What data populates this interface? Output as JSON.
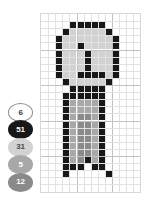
{
  "legend": {
    "items": [
      {
        "label": "6",
        "fill": "#ffffff",
        "text": "#3a3a3a",
        "outlined": true
      },
      {
        "label": "51",
        "fill": "#181818",
        "text": "#ffffff",
        "outlined": false
      },
      {
        "label": "31",
        "fill": "#d2d2d2",
        "text": "#4a4a4a",
        "outlined": false
      },
      {
        "label": "5",
        "fill": "#a8a8a8",
        "text": "#ffffff",
        "outlined": false
      },
      {
        "label": "12",
        "fill": "#8a8a8a",
        "text": "#ffffff",
        "outlined": false
      }
    ]
  },
  "grid": {
    "columns": 14,
    "rows": 25,
    "cell_size": 7.1,
    "line_color": "#e2e2e2",
    "border_color": "#d7d7d7",
    "palette": {
      "dark": "#181818",
      "light": "#d2d2d2",
      "mid": "#a8a8a8",
      "shade": "#8a8a8a",
      "empty": "#ffffff"
    },
    "pixels": [
      "..............",
      "....ddddd.....",
      "...dLLLLLd....",
      "..dLLLLLLLd...",
      "..dLLdLLLLd...",
      "..dLLLdLLLd...",
      "..dLLLdLLLd...",
      "..dLLLdLLLd...",
      "..dLLddddLd...",
      "...dLLLLLd....",
      "....ddddd.....",
      "...dddddd.....",
      "...dmmmmd.....",
      "...dmmmmd.....",
      "...dmssmd.....",
      "...dmssmd.....",
      "...dmssmd.....",
      "...dmssmd.....",
      "...dmssmd.....",
      "...dmssmd.....",
      "...dmsdmd.....",
      "...ddd.dd.....",
      "...d.....d....",
      "..............",
      ".............."
    ]
  }
}
